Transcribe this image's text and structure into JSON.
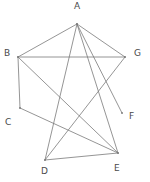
{
  "figure": {
    "kind": "undirected-graph-diagram",
    "width": 150,
    "height": 182,
    "background_color": "#ffffff",
    "edge_color": "#7a7a7a",
    "edge_width": 0.8,
    "label_color": "#4a4a4a",
    "label_font_size": 9
  },
  "nodes": [
    {
      "id": "A",
      "label": "A",
      "x": 77,
      "y": 24,
      "label_x": 74,
      "label_y": 2
    },
    {
      "id": "B",
      "label": "B",
      "x": 18,
      "y": 57,
      "label_x": 4,
      "label_y": 49
    },
    {
      "id": "C",
      "label": "C",
      "x": 20,
      "y": 108,
      "label_x": 5,
      "label_y": 118
    },
    {
      "id": "D",
      "label": "D",
      "x": 45,
      "y": 160,
      "label_x": 41,
      "label_y": 167
    },
    {
      "id": "E",
      "label": "E",
      "x": 118,
      "y": 153,
      "label_x": 114,
      "label_y": 164
    },
    {
      "id": "F",
      "label": "F",
      "x": 122,
      "y": 113,
      "label_x": 129,
      "label_y": 112
    },
    {
      "id": "G",
      "label": "G",
      "x": 125,
      "y": 57,
      "label_x": 134,
      "label_y": 49
    }
  ],
  "edges": [
    {
      "from": "A",
      "to": "B"
    },
    {
      "from": "A",
      "to": "G"
    },
    {
      "from": "A",
      "to": "D"
    },
    {
      "from": "A",
      "to": "E"
    },
    {
      "from": "A",
      "to": "F"
    },
    {
      "from": "B",
      "to": "G"
    },
    {
      "from": "B",
      "to": "C"
    },
    {
      "from": "B",
      "to": "E"
    },
    {
      "from": "C",
      "to": "E"
    },
    {
      "from": "D",
      "to": "E"
    },
    {
      "from": "D",
      "to": "G"
    }
  ]
}
